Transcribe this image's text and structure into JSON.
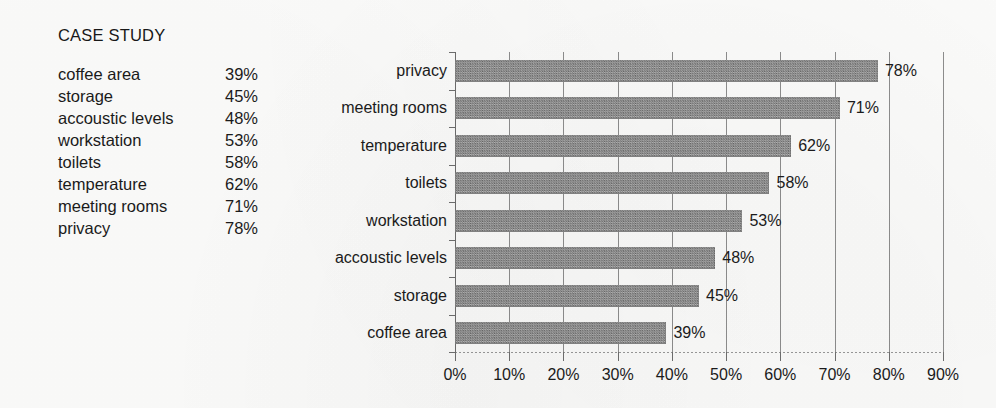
{
  "page": {
    "background_color": "#fdfdfc",
    "text_color": "#1b1b1b"
  },
  "case_study": {
    "title": "CASE STUDY",
    "rows": [
      {
        "label": "coffee area",
        "value": "39%"
      },
      {
        "label": "storage",
        "value": "45%"
      },
      {
        "label": "accoustic levels",
        "value": "48%"
      },
      {
        "label": "workstation",
        "value": "53%"
      },
      {
        "label": "toilets",
        "value": "58%"
      },
      {
        "label": "temperature",
        "value": "62%"
      },
      {
        "label": "meeting rooms",
        "value": "71%"
      },
      {
        "label": "privacy",
        "value": "78%"
      }
    ]
  },
  "chart_data": {
    "type": "bar",
    "orientation": "horizontal",
    "title": "",
    "subtitle": "",
    "xlabel": "",
    "ylabel": "",
    "categories": [
      "privacy",
      "meeting rooms",
      "temperature",
      "toilets",
      "workstation",
      "accoustic levels",
      "storage",
      "coffee area"
    ],
    "values": [
      78,
      71,
      62,
      58,
      53,
      48,
      45,
      39
    ],
    "data_labels": [
      "78%",
      "71%",
      "62%",
      "58%",
      "53%",
      "48%",
      "45%",
      "39%"
    ],
    "xlim": [
      0,
      90
    ],
    "xticks": [
      0,
      10,
      20,
      30,
      40,
      50,
      60,
      70,
      80,
      90
    ],
    "xtick_labels": [
      "0%",
      "10%",
      "20%",
      "30%",
      "40%",
      "50%",
      "60%",
      "70%",
      "80%",
      "90%"
    ],
    "grid": "vertical",
    "legend": "none",
    "bar_color": "#8a8a8a",
    "bar_texture": "halftone-dither",
    "gridline_color": "#8e8e8e",
    "axis_color": "#6f6f6f"
  }
}
